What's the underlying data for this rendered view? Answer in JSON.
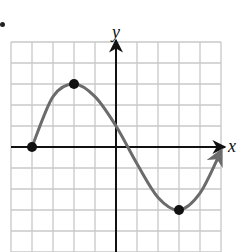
{
  "chart_data": {
    "type": "line",
    "title": "",
    "xlabel": "x",
    "ylabel": "y",
    "xlim": [
      -5,
      5
    ],
    "ylim": [
      -5,
      5
    ],
    "grid": true,
    "grid_step": 1,
    "tick_labels_shown": false,
    "series": [
      {
        "name": "f(x)",
        "description": "Smooth sine-like curve starting at (-4,0), rising to a maximum at (-2,3), crossing the y-axis near (0,1), falling to a minimum at (3,-3), then rising with an arrow toward the right edge.",
        "x": [
          -4,
          -3,
          -2,
          -1,
          0,
          1,
          2,
          3,
          4,
          5
        ],
        "y": [
          0,
          2.4,
          3,
          2.4,
          1,
          -0.8,
          -2.4,
          -3,
          -2.2,
          -0.2
        ],
        "end_arrow": "right"
      }
    ],
    "highlighted_points": [
      {
        "x": -4,
        "y": 0,
        "role": "left endpoint"
      },
      {
        "x": -2,
        "y": 3,
        "role": "relative maximum"
      },
      {
        "x": 3,
        "y": -3,
        "role": "relative minimum"
      }
    ],
    "colors": {
      "curve": "#6b6b6b",
      "axis": "#111111",
      "grid": "#c8c8c8",
      "points": "#111111"
    }
  },
  "labels": {
    "x_axis": "x",
    "y_axis": "y"
  }
}
